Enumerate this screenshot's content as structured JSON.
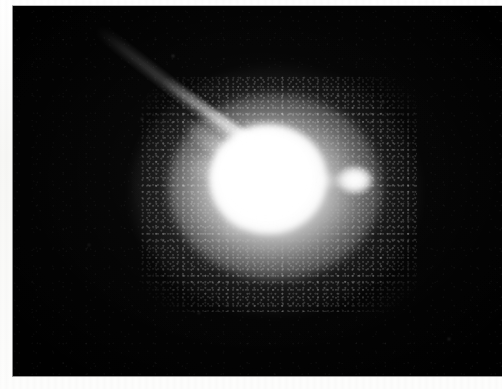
{
  "image": {
    "kind": "photographic-plate-scan",
    "subject": "bright saturated star-like source with radiating diffraction spikes, a faint linear jet and a small detached companion knot",
    "color_mode": "grayscale",
    "width_px": 502,
    "height_px": 389,
    "paper_color": "#fbfbfa",
    "field_color": "#000000",
    "source_color": "#ffffff"
  },
  "plate": {
    "frame_left_px": 13,
    "frame_top_px": 6,
    "frame_width_px": 489,
    "frame_height_px": 370,
    "margin_left_px": 13,
    "margin_top_px": 6,
    "margin_bottom_px": 13,
    "edge_color": "#9a9a9a"
  },
  "features": {
    "core": {
      "name": "saturated-core",
      "center_x_px": 255,
      "center_y_px": 173,
      "width_px": 118,
      "height_px": 110,
      "peak_brightness": 255
    },
    "halo": {
      "name": "diffuse-halo",
      "center_x_px": 263,
      "center_y_px": 185,
      "width_px": 290,
      "height_px": 250
    },
    "jet": {
      "name": "linear-jet",
      "start_x_px": 86,
      "start_y_px": 33,
      "end_x_px": 228,
      "end_y_px": 140,
      "position_angle_deg": 143,
      "brightness": "faint, brightening toward the core"
    },
    "companion": {
      "name": "companion-knot",
      "center_x_px": 355,
      "center_y_px": 180,
      "width_px": 36,
      "height_px": 28
    },
    "spikes": [
      {
        "name": "spike-upper-left",
        "angle_deg": 216,
        "length_px": 96,
        "thickness_px": 18,
        "opacity": 0.8
      },
      {
        "name": "spike-left",
        "angle_deg": 186,
        "length_px": 74,
        "thickness_px": 22,
        "opacity": 0.72
      },
      {
        "name": "spike-lower-left",
        "angle_deg": 112,
        "length_px": 74,
        "thickness_px": 24,
        "opacity": 0.78
      },
      {
        "name": "spike-lower-right",
        "angle_deg": 62,
        "length_px": 78,
        "thickness_px": 26,
        "opacity": 0.8
      },
      {
        "name": "spike-right",
        "angle_deg": 14,
        "length_px": 74,
        "thickness_px": 20,
        "opacity": 0.7
      },
      {
        "name": "spike-upper-right",
        "angle_deg": 330,
        "length_px": 66,
        "thickness_px": 16,
        "opacity": 0.46
      },
      {
        "name": "spike-up",
        "angle_deg": 276,
        "length_px": 52,
        "thickness_px": 18,
        "opacity": 0.4
      }
    ],
    "field_stars": [
      {
        "name": "field-star-1",
        "x_px": 172,
        "y_px": 55,
        "size_px": 2,
        "opacity": 0.3
      },
      {
        "name": "field-star-2",
        "x_px": 141,
        "y_px": 118,
        "size_px": 2,
        "opacity": 0.22
      },
      {
        "name": "field-star-3",
        "x_px": 382,
        "y_px": 101,
        "size_px": 2,
        "opacity": 0.26
      },
      {
        "name": "field-star-4",
        "x_px": 324,
        "y_px": 288,
        "size_px": 2,
        "opacity": 0.2
      },
      {
        "name": "field-star-5",
        "x_px": 198,
        "y_px": 312,
        "size_px": 2,
        "opacity": 0.18
      },
      {
        "name": "field-star-6",
        "x_px": 448,
        "y_px": 338,
        "size_px": 2,
        "opacity": 0.24
      },
      {
        "name": "field-star-7",
        "x_px": 88,
        "y_px": 244,
        "size_px": 2,
        "opacity": 0.17
      },
      {
        "name": "field-star-8",
        "x_px": 410,
        "y_px": 218,
        "size_px": 2,
        "opacity": 0.16
      }
    ]
  },
  "scan_artifacts": [
    {
      "name": "top-artifact-1",
      "x_px": 78,
      "y_px": 1,
      "width_px": 62,
      "height_px": 3,
      "opacity": 0.08
    },
    {
      "name": "top-artifact-2",
      "x_px": 196,
      "y_px": 0,
      "width_px": 44,
      "height_px": 3,
      "opacity": 0.07
    },
    {
      "name": "top-artifact-3",
      "x_px": 300,
      "y_px": 2,
      "width_px": 34,
      "height_px": 2,
      "opacity": 0.06
    },
    {
      "name": "top-artifact-4",
      "x_px": 392,
      "y_px": 1,
      "width_px": 50,
      "height_px": 2,
      "opacity": 0.05
    }
  ]
}
